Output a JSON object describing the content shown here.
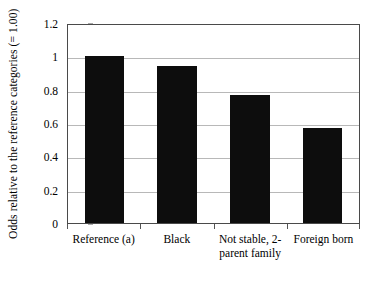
{
  "chart_data": {
    "type": "bar",
    "title": "",
    "subtitle": "",
    "xlabel": "",
    "ylabel": "Odds relative to the reference categories (= 1.00)",
    "categories": [
      "Reference (a)",
      "Black",
      "Not stable, 2-parent family",
      "Foreign born"
    ],
    "values": [
      1.0,
      0.94,
      0.77,
      0.57
    ],
    "ylim": [
      0,
      1.2
    ],
    "ytick_labels": [
      "0",
      "0.2",
      "0.4",
      "0.6",
      "0.8",
      "1",
      "1.2"
    ],
    "ytick_values": [
      0,
      0.2,
      0.4,
      0.6,
      0.8,
      1,
      1.2
    ],
    "grid": true,
    "legend": "none",
    "bar_color": "#0d0d0d",
    "grid_color": "#b8b8b8",
    "axis_color": "#4a4a4a",
    "background": "#ffffff"
  },
  "axis": {
    "y_title": "Odds relative to the reference categories (= 1.00)"
  },
  "x_labels": [
    {
      "line1": "Reference (a)",
      "line2": ""
    },
    {
      "line1": "Black",
      "line2": ""
    },
    {
      "line1": "Not stable, 2-",
      "line2": "parent family"
    },
    {
      "line1": "Foreign born",
      "line2": ""
    }
  ]
}
